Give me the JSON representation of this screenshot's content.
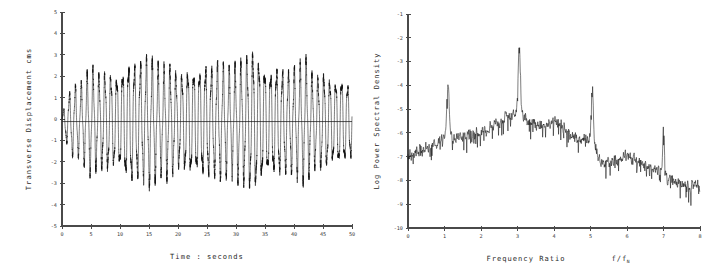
{
  "figure": {
    "panels": [
      "timeseries",
      "spectrum"
    ]
  },
  "chart_data": [
    {
      "id": "timeseries",
      "type": "line",
      "title": "",
      "xlabel": "Time : seconds",
      "ylabel": "Transverse Displacement  cms",
      "xlim": [
        0,
        50
      ],
      "ylim": [
        -5,
        5
      ],
      "xticks": [
        0,
        5,
        10,
        15,
        20,
        25,
        30,
        35,
        40,
        45,
        50
      ],
      "xticklabels": [
        "0",
        "5",
        "10",
        "15",
        "20",
        "25",
        "30",
        "35",
        "40",
        "45",
        "50"
      ],
      "yticks": [
        -5,
        -4,
        -3,
        -2,
        -1,
        0,
        1,
        2,
        3,
        4,
        5
      ],
      "yticklabels": [
        "-5",
        "-4",
        "-3",
        "-2",
        "-1",
        "0",
        "1",
        "2",
        "3",
        "4",
        "5"
      ],
      "grid": false,
      "legend": null,
      "zero_reference_line": true,
      "description": "Oscillatory transverse displacement record; amplitude grows from about +/-1 cm near t=0 to a sustained band of roughly +/-2.5 to +/-3 cm, peaking near 3.5 cm at about t=33 s.",
      "series": [
        {
          "name": "transverse displacement",
          "color": "#111111",
          "oscillation": {
            "base_frequency_hz": 0.98,
            "secondary_frequency_hz": 3.02,
            "secondary_amplitude_ratio": 0.18,
            "phase": 0.0,
            "mean_offset": -0.12,
            "samples_per_second": 40
          },
          "envelope_x": [
            0,
            1,
            2,
            3,
            4,
            5,
            6,
            7,
            8,
            9,
            10,
            11,
            12,
            13,
            14,
            15,
            16,
            17,
            18,
            19,
            20,
            21,
            22,
            23,
            24,
            25,
            26,
            27,
            28,
            29,
            30,
            31,
            32,
            33,
            34,
            35,
            36,
            37,
            38,
            39,
            40,
            41,
            42,
            43,
            44,
            45,
            46,
            47,
            48,
            49,
            50
          ],
          "envelope_y": [
            0.35,
            1.25,
            1.75,
            1.7,
            2.15,
            2.7,
            2.25,
            2.35,
            2.45,
            2.3,
            2.35,
            2.9,
            3.05,
            2.85,
            2.95,
            3.15,
            2.85,
            2.55,
            2.8,
            2.6,
            2.3,
            2.45,
            2.75,
            2.6,
            2.7,
            2.85,
            2.6,
            2.9,
            2.7,
            2.55,
            2.8,
            2.95,
            3.2,
            3.5,
            3.1,
            2.7,
            2.55,
            2.8,
            2.6,
            2.45,
            2.6,
            2.75,
            3.1,
            2.35,
            2.2,
            2.4,
            2.15,
            2.05,
            2.25,
            1.95,
            1.85
          ]
        }
      ]
    },
    {
      "id": "spectrum",
      "type": "line",
      "title": "",
      "xlabel": "Frequency Ratio",
      "xlabel_symbol": "f/f",
      "xlabel_symbol_sub": "N",
      "ylabel": "Log Power Spectral Density",
      "xlim": [
        0,
        8
      ],
      "ylim": [
        -10,
        -1
      ],
      "xticks": [
        0,
        1,
        2,
        3,
        4,
        5,
        6,
        7,
        8
      ],
      "xticklabels": [
        "0",
        "1",
        "2",
        "3",
        "4",
        "5",
        "6",
        "7",
        "8"
      ],
      "yticks": [
        -10,
        -9,
        -8,
        -7,
        -6,
        -5,
        -4,
        -3,
        -2,
        -1
      ],
      "yticklabels": [
        "-10",
        "-9",
        "-8",
        "-7",
        "-6",
        "-5",
        "-4",
        "-3",
        "-2",
        "-1"
      ],
      "grid": false,
      "legend": null,
      "zero_reference_line": false,
      "description": "Log power spectral density of the displacement record, showing a dominant narrow peak at frequency ratio 3.05 reaching about -2.3, with subsidiary peaks at 1.1, 5.05 and 7.0 and a broad hump near 6.",
      "series": [
        {
          "name": "log power spectral density",
          "color": "#111111",
          "noise_amplitude": 0.3,
          "samples": 900,
          "baseline_x": [
            0.0,
            0.25,
            0.5,
            0.75,
            1.0,
            1.25,
            1.5,
            1.75,
            2.0,
            2.25,
            2.5,
            2.75,
            3.0,
            3.15,
            3.3,
            3.6,
            3.9,
            4.1,
            4.4,
            4.7,
            5.0,
            5.15,
            5.3,
            5.6,
            6.0,
            6.3,
            6.6,
            6.9,
            7.1,
            7.4,
            7.7,
            8.0
          ],
          "baseline_y": [
            -7.05,
            -6.7,
            -6.55,
            -6.45,
            -6.25,
            -6.2,
            -6.2,
            -6.1,
            -6.0,
            -5.8,
            -5.55,
            -5.25,
            -5.15,
            -5.3,
            -5.55,
            -5.65,
            -5.6,
            -5.5,
            -6.1,
            -6.25,
            -6.35,
            -6.7,
            -7.3,
            -7.2,
            -6.95,
            -7.2,
            -7.5,
            -7.55,
            -7.95,
            -8.15,
            -8.25,
            -8.2
          ],
          "peaks": [
            {
              "center": 1.1,
              "height": 2.15,
              "width": 0.035,
              "label": "first harmonic peak"
            },
            {
              "center": 3.05,
              "height": 2.95,
              "width": 0.03,
              "label": "dominant peak"
            },
            {
              "center": 5.05,
              "height": 2.35,
              "width": 0.028,
              "label": "third peak"
            },
            {
              "center": 7.0,
              "height": 2.0,
              "width": 0.022,
              "label": "fourth peak"
            }
          ],
          "peak_summary": [
            {
              "frequency_ratio": 1.1,
              "value": -4.2
            },
            {
              "frequency_ratio": 3.05,
              "value": -2.3
            },
            {
              "frequency_ratio": 5.05,
              "value": -4.1
            },
            {
              "frequency_ratio": 7.0,
              "value": -5.65
            }
          ]
        }
      ]
    }
  ]
}
